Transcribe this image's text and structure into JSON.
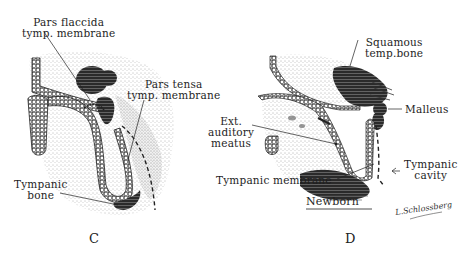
{
  "figure": {
    "panels": [
      {
        "id": "C",
        "letter": "C",
        "labels": {
          "pars_flaccida": [
            "Pars flaccida",
            "tymp. membrane"
          ],
          "pars_tensa": [
            "Pars tensa",
            "tymp. membrane"
          ],
          "tympanic_bone": [
            "Tympanic",
            "bone"
          ]
        }
      },
      {
        "id": "D",
        "letter": "D",
        "caption": "Newborn",
        "labels": {
          "squamous": [
            "Squamous",
            "temp.bone"
          ],
          "malleus": "Malleus",
          "ext_auditory_meatus": [
            "Ext.",
            "auditory",
            "meatus"
          ],
          "tympanic_membrane": "Tympanic membrane",
          "tympanic_cavity": [
            "Tympanic",
            "cavity"
          ]
        },
        "signature": "L.Schlossberg"
      }
    ]
  }
}
